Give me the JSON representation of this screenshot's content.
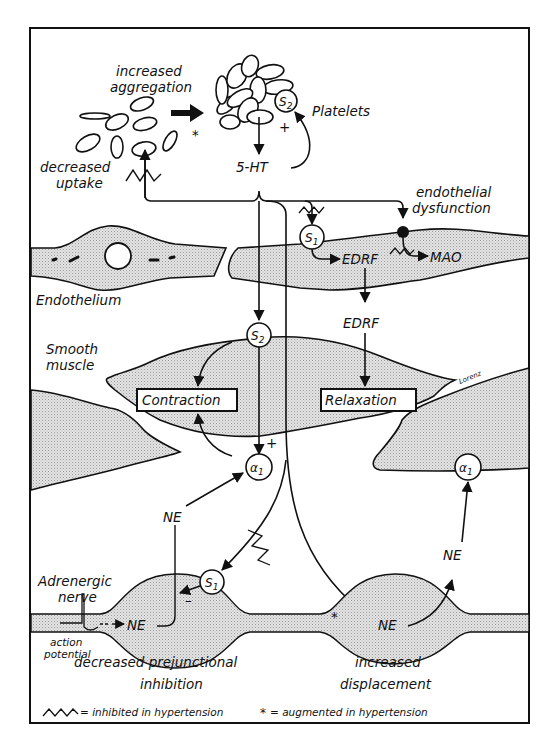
{
  "diagram": {
    "colors": {
      "ink": "#111111",
      "stipple": "#cfcfcf",
      "background": "#ffffff"
    },
    "platelets": {
      "label": "Platelets",
      "aggregation_label_line1": "increased",
      "aggregation_label_line2": "aggregation",
      "receptor": "S",
      "receptor_sub": "2",
      "feedback_sign": "+",
      "asterisk": "*"
    },
    "serotonin": {
      "label": "5-HT",
      "uptake_label_line1": "decreased",
      "uptake_label_line2": "uptake"
    },
    "endothelium": {
      "label": "Endothelium",
      "dysfunction_line1": "endothelial",
      "dysfunction_line2": "dysfunction",
      "receptor": "S",
      "receptor_sub": "1",
      "edrf_inner": "EDRF",
      "mao": "MAO",
      "edrf_released": "EDRF"
    },
    "smooth_muscle": {
      "label_line1": "Smooth",
      "label_line2": "muscle",
      "receptor_s2": "S",
      "receptor_s2_sub": "2",
      "alpha_left": "α",
      "alpha_left_sub": "1",
      "alpha_right": "α",
      "alpha_right_sub": "1",
      "contraction": "Contraction",
      "relaxation": "Relaxation",
      "plus_sign": "+",
      "signature": "Lorenz"
    },
    "nerve": {
      "label_line1": "Adrenergic",
      "label_line2": "nerve",
      "action_line1": "action",
      "action_line2": "potential",
      "ne_left_varicosity": "NE",
      "ne_left_released": "NE",
      "ne_right_varicosity": "NE",
      "ne_right_released": "NE",
      "presyn_receptor": "S",
      "presyn_receptor_sub": "1",
      "minus_sign": "–",
      "asterisk": "*"
    },
    "captions": {
      "left_line1": "decreased  prejunctional",
      "left_line2": "inhibition",
      "right_line1": "increased",
      "right_line2": "displacement"
    },
    "legend": {
      "inhibited_symbol": "zigzag-icon",
      "inhibited_text": "= inhibited in hypertension",
      "augmented_symbol": "*",
      "augmented_text": "= augmented in hypertension"
    }
  }
}
